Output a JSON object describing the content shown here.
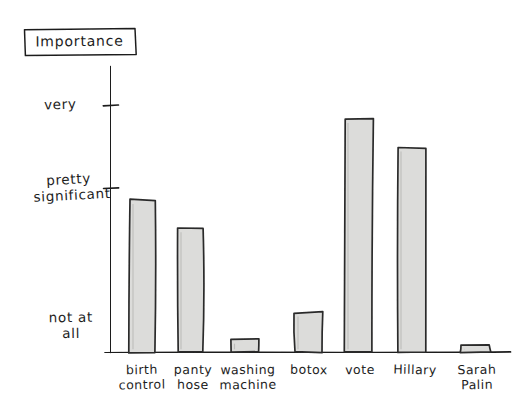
{
  "chart_data": {
    "type": "bar",
    "title": "Importance",
    "xlabel": "",
    "ylabel": "Importance",
    "grid": false,
    "legend": "none",
    "style": "hand-drawn sketch",
    "categories": [
      "birth control",
      "panty hose",
      "washing machine",
      "botox",
      "vote",
      "Hillary",
      "Sarah Palin"
    ],
    "category_lines": [
      [
        "birth",
        "control"
      ],
      [
        "panty",
        "hose"
      ],
      [
        "washing",
        "machine"
      ],
      [
        "botox",
        ""
      ],
      [
        "vote",
        ""
      ],
      [
        "Hillary",
        ""
      ],
      [
        "Sarah",
        "Palin"
      ]
    ],
    "y_tick_labels": [
      "not at all",
      "pretty significant",
      "very"
    ],
    "y_tick_label_lines": [
      [
        "not at",
        "all"
      ],
      [
        "pretty",
        "significant"
      ],
      [
        "very",
        ""
      ]
    ],
    "y_tick_values": [
      0,
      1,
      2
    ],
    "ylim": [
      0,
      2.72
    ],
    "values": [
      1.45,
      1.18,
      0.12,
      0.38,
      2.22,
      1.95,
      0.07
    ],
    "value_labels": [
      "pretty significant+",
      "pretty significant",
      "not at all+",
      "between not at all and pretty significant",
      "above very",
      "very",
      "not at all"
    ],
    "bar_fill": "#dcdcda",
    "bar_stroke": "#2b2b2b",
    "axis_color": "#1f1f1f",
    "background": "#ffffff"
  },
  "title_box": {
    "label": "Importance"
  }
}
